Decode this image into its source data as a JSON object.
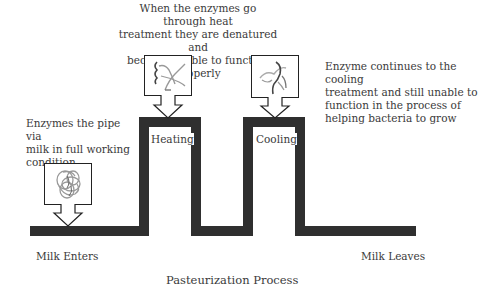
{
  "title": "Pasteurization Process",
  "annotations": {
    "heat": "When the enzymes go through heat treatment they are denatured and become unable to function properly",
    "heat_lines": [
      "When the enzymes go through heat",
      "treatment they are denatured and",
      "become unable to function properly"
    ],
    "cool_lines": [
      "Enzyme continues to the cooling",
      "treatment and still unable to",
      "function in the process of",
      "helping bacteria to grow"
    ],
    "start_lines": [
      "Enzymes the pipe via",
      "milk in full working",
      "condition"
    ]
  },
  "stages": {
    "heating": "Heating",
    "cooling": "Cooling"
  },
  "endpoints": {
    "enter": "Milk Enters",
    "leave": "Milk Leaves"
  },
  "enzyme_states": [
    {
      "name": "active-enzyme",
      "state": "coiled"
    },
    {
      "name": "denatured-enzyme-heating",
      "state": "unfolded"
    },
    {
      "name": "denatured-enzyme-cooling",
      "state": "unfolded"
    }
  ],
  "colors": {
    "pipe": "#2f2f2f",
    "text": "#3a3a3a",
    "enzyme_gray": "#9a9a9a",
    "enzyme_dark": "#444444"
  }
}
